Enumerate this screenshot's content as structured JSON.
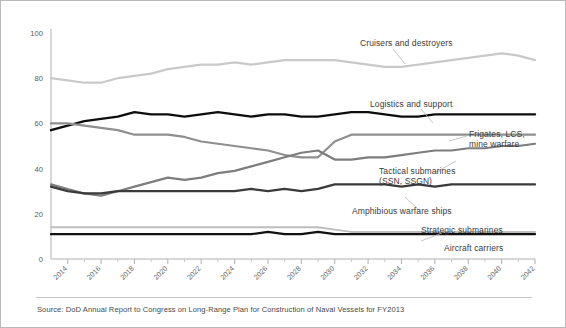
{
  "figure": {
    "source_note": "Source: DoD Annual Report to Congress on Long-Range Plan for Construction of Naval Vessels for FY2013"
  },
  "chart_data": {
    "type": "line",
    "title": "",
    "xlabel": "",
    "ylabel": "",
    "xlim": [
      2013,
      2042
    ],
    "ylim": [
      0,
      100
    ],
    "yticks": [
      0,
      20,
      40,
      60,
      80,
      100
    ],
    "grid": false,
    "legend_position": "inline-annotations",
    "x": [
      2013,
      2014,
      2015,
      2016,
      2017,
      2018,
      2019,
      2020,
      2021,
      2022,
      2023,
      2024,
      2025,
      2026,
      2027,
      2028,
      2029,
      2030,
      2031,
      2032,
      2033,
      2034,
      2035,
      2036,
      2037,
      2038,
      2039,
      2040,
      2041,
      2042
    ],
    "tick_labels": [
      "2014",
      "2016",
      "2018",
      "2020",
      "2022",
      "2024",
      "2026",
      "2028",
      "2030",
      "2032",
      "2034",
      "2036",
      "2038",
      "2040",
      "2042"
    ],
    "series": [
      {
        "name": "Cruisers and destroyers",
        "color": "#c9c9c9",
        "width": 2.2,
        "values": [
          80,
          79,
          78,
          78,
          80,
          81,
          82,
          84,
          85,
          86,
          86,
          87,
          86,
          87,
          88,
          88,
          88,
          88,
          87,
          86,
          85,
          85,
          86,
          87,
          88,
          89,
          90,
          91,
          90,
          88
        ]
      },
      {
        "name": "Logistics and support",
        "color": "#0d0d0d",
        "width": 2.4,
        "values": [
          57,
          59,
          61,
          62,
          63,
          65,
          64,
          64,
          63,
          64,
          65,
          64,
          63,
          64,
          64,
          63,
          63,
          64,
          65,
          65,
          64,
          63,
          63,
          64,
          64,
          64,
          64,
          64,
          64,
          64
        ]
      },
      {
        "name": "Frigates, LCS, mine warfare",
        "color": "#8f8f8f",
        "width": 2.2,
        "values": [
          60,
          60,
          59,
          58,
          57,
          55,
          55,
          55,
          54,
          52,
          51,
          50,
          49,
          48,
          46,
          45,
          45,
          52,
          55,
          55,
          55,
          55,
          55,
          55,
          55,
          55,
          55,
          55,
          55,
          55
        ]
      },
      {
        "name": "Tactical submarines (SSN, SSGN)",
        "color": "#7d7d7d",
        "width": 2.2,
        "values": [
          33,
          31,
          29,
          28,
          30,
          32,
          34,
          36,
          35,
          36,
          38,
          39,
          41,
          43,
          45,
          47,
          48,
          44,
          44,
          45,
          45,
          46,
          47,
          48,
          48,
          49,
          49,
          50,
          50,
          51
        ]
      },
      {
        "name": "Amphibious warfare ships",
        "color": "#3a3a3a",
        "width": 2.3,
        "values": [
          32,
          30,
          29,
          29,
          30,
          30,
          30,
          30,
          30,
          30,
          30,
          30,
          31,
          30,
          31,
          30,
          31,
          33,
          33,
          33,
          33,
          32,
          33,
          32,
          33,
          33,
          33,
          33,
          33,
          33
        ]
      },
      {
        "name": "Strategic submarines",
        "color": "#bdbdbd",
        "width": 2.0,
        "values": [
          14,
          14,
          14,
          14,
          14,
          14,
          14,
          14,
          14,
          14,
          14,
          14,
          14,
          14,
          14,
          14,
          14,
          13,
          12,
          12,
          12,
          12,
          12,
          12,
          12,
          12,
          12,
          12,
          12,
          12
        ]
      },
      {
        "name": "Aircraft carriers",
        "color": "#111111",
        "width": 2.2,
        "values": [
          11,
          11,
          11,
          11,
          11,
          11,
          11,
          11,
          11,
          11,
          11,
          11,
          11,
          12,
          11,
          11,
          12,
          11,
          11,
          11,
          11,
          11,
          11,
          11,
          11,
          11,
          11,
          11,
          11,
          11
        ]
      }
    ],
    "annotations": [
      {
        "key": "cruisers",
        "text": "Cruisers and destroyers"
      },
      {
        "key": "logistics",
        "text": "Logistics and support"
      },
      {
        "key": "frigates_l1",
        "text": "Frigates, LCS,"
      },
      {
        "key": "frigates_l2",
        "text": "mine warfare"
      },
      {
        "key": "tactical_l1",
        "text": "Tactical submarines"
      },
      {
        "key": "tactical_l2",
        "text": "(SSN, SSGN)"
      },
      {
        "key": "amphibious",
        "text": "Amphibious warfare ships"
      },
      {
        "key": "strategic",
        "text": "Strategic submarines"
      },
      {
        "key": "carriers",
        "text": "Aircraft carriers"
      }
    ]
  }
}
